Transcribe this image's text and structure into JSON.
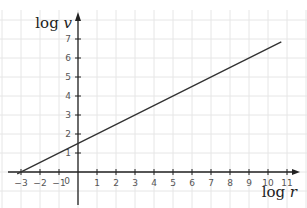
{
  "chart_data": {
    "type": "line",
    "title": "",
    "xlabel": "log r",
    "ylabel": "log v",
    "xlabel_parts": {
      "fn": "log",
      "var": "r"
    },
    "ylabel_parts": {
      "fn": "log",
      "var": "v"
    },
    "x_ticks": [
      -3,
      -2,
      -1,
      1,
      2,
      3,
      4,
      5,
      6,
      7,
      8,
      9,
      10,
      11
    ],
    "y_ticks": [
      1,
      2,
      3,
      4,
      5,
      6,
      7
    ],
    "origin_label": "0",
    "xlim": [
      -3.5,
      11.8
    ],
    "ylim": [
      -2,
      8
    ],
    "grid": true,
    "series": [
      {
        "name": "line",
        "x": [
          -3.2,
          10.7
        ],
        "y": [
          -0.1,
          6.85
        ]
      }
    ]
  }
}
